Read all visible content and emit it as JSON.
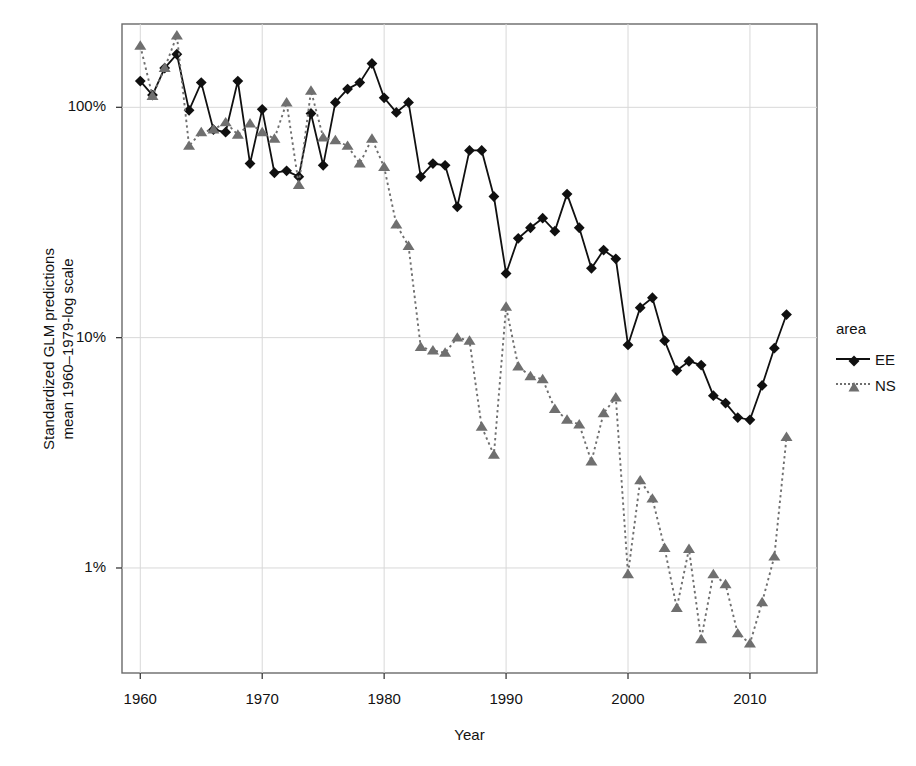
{
  "chart_data": {
    "type": "line",
    "title": "",
    "xlabel": "Year",
    "ylabel": "Standardized GLM predictions\nmean 1960–1979-log scale",
    "yscale": "log",
    "ylim": [
      0.35,
      230
    ],
    "xlim": [
      1958.5,
      2015.5
    ],
    "ytick_values": [
      100,
      10,
      1
    ],
    "ytick_labels": [
      "100%",
      "10%",
      "1%"
    ],
    "xtick_values": [
      1960,
      1970,
      1980,
      1990,
      2000,
      2010
    ],
    "xtick_labels": [
      "1960",
      "1970",
      "1980",
      "1990",
      "2000",
      "2010"
    ],
    "grid": true,
    "legend_position": "right",
    "legend_title": "area",
    "series": [
      {
        "name": "EE",
        "label": "EE",
        "color": "#101010",
        "linestyle": "solid",
        "marker": "diamond",
        "x": [
          1960,
          1961,
          1962,
          1963,
          1964,
          1965,
          1966,
          1967,
          1968,
          1969,
          1970,
          1971,
          1972,
          1973,
          1974,
          1975,
          1976,
          1977,
          1978,
          1979,
          1980,
          1981,
          1982,
          1983,
          1984,
          1985,
          1986,
          1987,
          1988,
          1989,
          1990,
          1991,
          1992,
          1993,
          1994,
          1995,
          1996,
          1997,
          1998,
          1999,
          2000,
          2001,
          2002,
          2003,
          2004,
          2005,
          2006,
          2007,
          2008,
          2009,
          2010,
          2011,
          2012,
          2013
        ],
        "values": [
          130,
          113,
          148,
          170,
          97,
          128,
          80,
          78,
          130,
          57,
          98,
          52,
          53,
          50,
          94,
          56,
          105,
          120,
          128,
          155,
          110,
          95,
          105,
          50,
          57,
          56,
          37,
          65,
          65,
          41,
          19,
          27,
          30,
          33,
          29,
          42,
          30,
          20,
          24,
          22,
          9.3,
          13.5,
          14.9,
          9.7,
          7.2,
          7.9,
          7.6,
          5.6,
          5.2,
          4.5,
          4.4,
          6.2,
          9.0,
          12.6
        ]
      },
      {
        "name": "NS",
        "label": "NS",
        "color": "#6f6f6f",
        "linestyle": "dotted",
        "marker": "triangle",
        "x": [
          1960,
          1961,
          1962,
          1963,
          1964,
          1965,
          1966,
          1967,
          1968,
          1969,
          1970,
          1971,
          1972,
          1973,
          1974,
          1975,
          1976,
          1977,
          1978,
          1979,
          1980,
          1981,
          1982,
          1983,
          1984,
          1985,
          1986,
          1987,
          1988,
          1989,
          1990,
          1991,
          1992,
          1993,
          1994,
          1995,
          1996,
          1997,
          1998,
          1999,
          2000,
          2001,
          2002,
          2003,
          2004,
          2005,
          2006,
          2007,
          2008,
          2009,
          2010,
          2011,
          2012,
          2013
        ],
        "values": [
          185,
          112,
          148,
          205,
          68,
          78,
          80,
          86,
          76,
          85,
          78,
          73,
          105,
          46,
          118,
          74,
          72,
          68,
          57,
          73,
          55,
          31,
          25,
          9.1,
          8.8,
          8.6,
          10.0,
          9.7,
          4.1,
          3.1,
          13.6,
          7.5,
          6.8,
          6.6,
          4.9,
          4.4,
          4.2,
          2.9,
          4.7,
          5.5,
          0.94,
          2.4,
          2.0,
          1.22,
          0.67,
          1.21,
          0.49,
          0.94,
          0.85,
          0.52,
          0.47,
          0.71,
          1.12,
          3.7
        ]
      }
    ]
  },
  "axis": {
    "y_label_line1": "Standardized GLM predictions",
    "y_label_line2": "mean 1960–1979-log scale",
    "x_label": "Year"
  },
  "legend": {
    "title": "area",
    "items": [
      {
        "label": "EE",
        "marker": "diamond-marker",
        "color": "#101010"
      },
      {
        "label": "NS",
        "marker": "triangle-marker",
        "color": "#6f6f6f"
      }
    ]
  }
}
